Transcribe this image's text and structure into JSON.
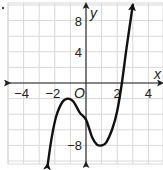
{
  "chart_data": {
    "type": "line",
    "title": "",
    "xlabel": "x",
    "ylabel": "y",
    "origin_label": "O",
    "xlim": [
      -5.0,
      4.9
    ],
    "ylim": [
      -10.4,
      10.3
    ],
    "grid": true,
    "grid_step": {
      "x": 1,
      "y": 2
    },
    "x_ticks": [
      {
        "value": -4,
        "label": "−4"
      },
      {
        "value": -2,
        "label": "−2"
      },
      {
        "value": 2,
        "label": "2"
      },
      {
        "value": 4,
        "label": "4"
      }
    ],
    "y_ticks": [
      {
        "value": 8,
        "label": "8"
      },
      {
        "value": 4,
        "label": "4"
      },
      {
        "value": -8,
        "label": "−8"
      }
    ],
    "series": [
      {
        "name": "cubic function",
        "color": "#111111",
        "arrows": "both-ends",
        "points": [
          [
            -2.45,
            -10.4
          ],
          [
            -2.2,
            -7.0
          ],
          [
            -1.9,
            -4.2
          ],
          [
            -1.5,
            -2.4
          ],
          [
            -1.15,
            -2.0
          ],
          [
            -0.8,
            -2.4
          ],
          [
            -0.4,
            -3.8
          ],
          [
            0.0,
            -4.7
          ],
          [
            0.4,
            -7.0
          ],
          [
            0.7,
            -7.9
          ],
          [
            1.0,
            -8.0
          ],
          [
            1.3,
            -7.6
          ],
          [
            1.7,
            -5.8
          ],
          [
            2.0,
            -3.6
          ],
          [
            2.3,
            0.0
          ],
          [
            2.6,
            4.5
          ],
          [
            3.0,
            10.0
          ]
        ]
      }
    ],
    "features": {
      "local_max": [
        -1.15,
        -2
      ],
      "local_min": [
        1,
        -8
      ],
      "x_intercept": 2.3,
      "y_intercept": -4.7
    }
  },
  "colors": {
    "grid": "#d8d8d8",
    "axis": "#222222",
    "curve": "#111111",
    "background": "#ffffff"
  }
}
